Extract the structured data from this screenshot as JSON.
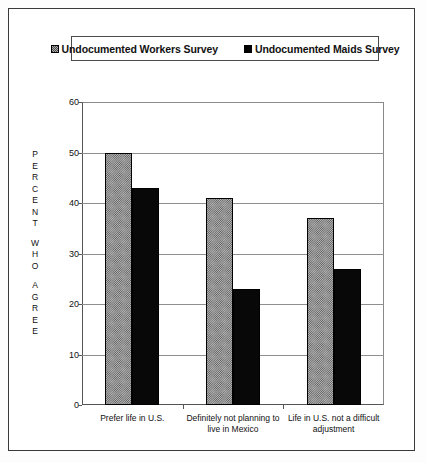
{
  "chart_data": {
    "type": "bar",
    "title": "",
    "xlabel": "",
    "ylabel": "PERCENT WHO AGREE",
    "ylim": [
      0,
      60
    ],
    "ytick_step": 10,
    "yticks": [
      0,
      10,
      20,
      30,
      40,
      50,
      60
    ],
    "grid": true,
    "legend_position": "top",
    "categories": [
      "Prefer life in U.S.",
      "Definitely not planning to live in Mexico",
      "Life in U.S. not a difficult adjustment"
    ],
    "category_lines": [
      [
        "Prefer life in U.S."
      ],
      [
        "Definitely not planning to",
        "live in Mexico"
      ],
      [
        "Life in U.S. not a difficult",
        "adjustment"
      ]
    ],
    "series": [
      {
        "name": "Undocumented Workers Survey",
        "fill": "hatch",
        "color": "#b4b4b4",
        "values": [
          50,
          41,
          37
        ]
      },
      {
        "name": "Undocumented Maids Survey",
        "fill": "solid",
        "color": "#080808",
        "values": [
          43,
          23,
          27
        ]
      }
    ]
  },
  "ylabel_chars": [
    "P",
    "E",
    "R",
    "C",
    "E",
    "N",
    "T",
    "gap",
    "W",
    "H",
    "O",
    "gap",
    "A",
    "G",
    "R",
    "E",
    "E"
  ],
  "legend": {
    "entries": [
      {
        "label": "Undocumented Workers Survey",
        "swatch": "hatch-swatch"
      },
      {
        "label": "Undocumented Maids Survey",
        "swatch": "solid-swatch"
      }
    ]
  }
}
